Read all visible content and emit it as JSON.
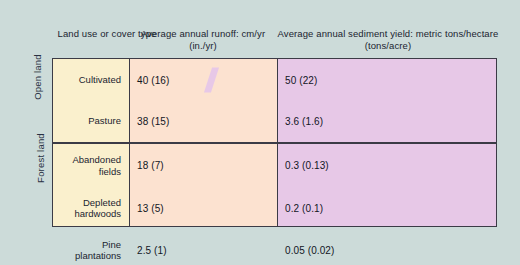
{
  "figure": {
    "background_color": "#ccdbd9",
    "bar_color": "#cc4026",
    "columns": {
      "label_header": "Land use or\ncover type",
      "runoff_header": "Average annual runoff:\ncm/yr (in./yr)",
      "sediment_header": "Average annual sediment yield:\nmetric tons/hectare (tons/acre)"
    },
    "groups": [
      {
        "name": "Open land"
      },
      {
        "name": "Forest land"
      }
    ]
  },
  "chart_data": {
    "type": "bar",
    "title": "",
    "categories": [
      "Cultivated",
      "Pasture",
      "Abandoned\nfields",
      "Depleted\nhardwoods",
      "Pine\nplantations"
    ],
    "groups": [
      "Open land",
      "Open land",
      "Forest land",
      "Forest land",
      "Forest land"
    ],
    "series": [
      {
        "name": "Average annual runoff: cm/yr (in./yr)",
        "unit": "cm/yr",
        "alt_unit": "in./yr",
        "values": [
          40,
          38,
          18,
          13,
          2.5
        ],
        "alt_values": [
          16,
          15,
          7,
          5,
          1
        ],
        "labels": [
          "40 (16)",
          "38 (15)",
          "18 (7)",
          "13 (5)",
          "2.5 (1)"
        ]
      },
      {
        "name": "Average annual sediment yield: metric tons/hectare (tons/acre)",
        "unit": "metric tons/hectare",
        "alt_unit": "tons/acre",
        "values": [
          50,
          3.6,
          0.3,
          0.2,
          0.05
        ],
        "alt_values": [
          22,
          1.6,
          0.13,
          0.1,
          0.02
        ],
        "labels": [
          "50 (22)",
          "3.6 (1.6)",
          "0.3 (0.13)",
          "0.2 (0.1)",
          "0.05 (0.02)"
        ],
        "broken_axis_rows": [
          0
        ]
      }
    ],
    "xlabel": "",
    "ylabel": "",
    "grid": false,
    "legend": "none"
  },
  "rows": [
    {
      "label": "Cultivated",
      "runoff_label": "40 (16)",
      "runoff_bar_pct": 73,
      "sediment_label": "50 (22)",
      "sediment_bar_pct": 75,
      "sediment_broken": true
    },
    {
      "label": "Pasture",
      "runoff_label": "38 (15)",
      "runoff_bar_pct": 70,
      "sediment_label": "3.6 (1.6)",
      "sediment_bar_pct": 59,
      "sediment_broken": false
    },
    {
      "label": "Abandoned\nfields",
      "runoff_label": "18 (7)",
      "runoff_bar_pct": 33,
      "sediment_label": "0.3 (0.13)",
      "sediment_bar_pct": 3.2,
      "sediment_broken": false
    },
    {
      "label": "Depleted\nhardwoods",
      "runoff_label": "13 (5)",
      "runoff_bar_pct": 24,
      "sediment_label": "0.2 (0.1)",
      "sediment_bar_pct": 2.7,
      "sediment_broken": false
    },
    {
      "label": "Pine\nplantations",
      "runoff_label": "2.5 (1)",
      "runoff_bar_pct": 5,
      "sediment_label": "0.05 (0.02)",
      "sediment_bar_pct": 2.2,
      "sediment_broken": false
    }
  ]
}
